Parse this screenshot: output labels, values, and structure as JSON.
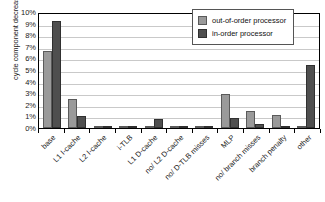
{
  "chart_data": {
    "type": "bar",
    "title": "",
    "xlabel": "",
    "ylabel": "cycle component decrease",
    "ylim": [
      0,
      10
    ],
    "yunit": "%",
    "grid": true,
    "legend_position": "top-right",
    "categories": [
      "base",
      "L1 I-cache",
      "L2 I-cache",
      "i-TLB",
      "L1 D-cache",
      "no/ L2 D-cache",
      "no/ D-TLB misses",
      "MLP",
      "no/ branch misses",
      "branch penalty",
      "other"
    ],
    "ytick_labels": [
      "10%",
      "9%",
      "8%",
      "7%",
      "6%",
      "5%",
      "4%",
      "3%",
      "2%",
      "1%",
      "0%"
    ],
    "ytick_values": [
      10,
      9,
      8,
      7,
      6,
      5,
      4,
      3,
      2,
      1,
      0
    ],
    "series": [
      {
        "name": "out-of-order processor",
        "color": "#9a9a9a",
        "values": [
          6.6,
          2.5,
          0.05,
          0.0,
          0.15,
          0.0,
          0.08,
          2.95,
          1.45,
          1.15,
          0.2
        ]
      },
      {
        "name": "in-order processor",
        "color": "#4f4f4f",
        "values": [
          9.2,
          1.05,
          0.05,
          0.0,
          0.8,
          0.0,
          0.05,
          0.9,
          0.35,
          0.0,
          5.4
        ]
      }
    ]
  }
}
